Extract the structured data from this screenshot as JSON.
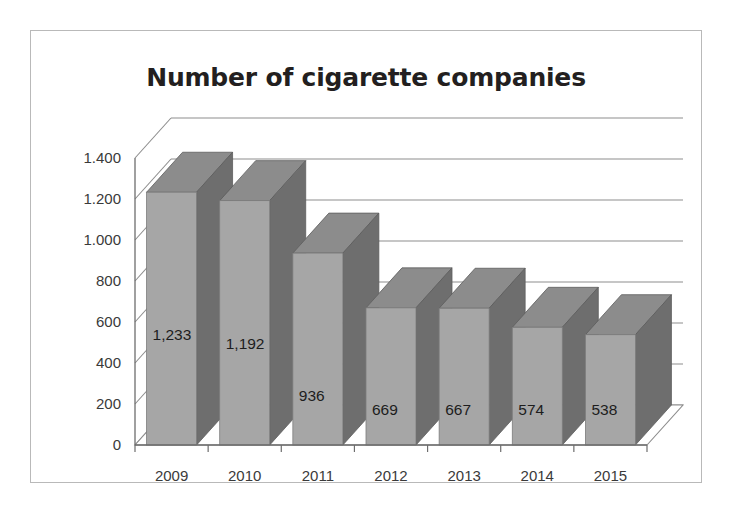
{
  "chart_data": {
    "type": "bar",
    "title": "Number of cigarette companies",
    "xlabel": "",
    "ylabel": "",
    "categories": [
      "2009",
      "2010",
      "2011",
      "2012",
      "2013",
      "2014",
      "2015"
    ],
    "values": [
      1233,
      1192,
      936,
      669,
      667,
      574,
      538
    ],
    "data_labels": [
      "1,233",
      "1,192",
      "936",
      "669",
      "667",
      "574",
      "538"
    ],
    "ytick_labels": [
      "1.400",
      "1.200",
      "1.000",
      "800",
      "600",
      "400",
      "200",
      "0"
    ],
    "ytick_values": [
      1400,
      1200,
      1000,
      800,
      600,
      400,
      200,
      0
    ],
    "ylim": [
      0,
      1400
    ],
    "grid": true,
    "legend": false,
    "style": "3d-column",
    "colors": {
      "bar_front": "#a6a6a6",
      "bar_side": "#6e6e6e",
      "bar_top": "#8c8c8c",
      "gridline": "#8d8d8d",
      "axis": "#6d6d6d",
      "title_text": "#231f20",
      "label_text": "#3a3a3a",
      "border": "#b9b9b9",
      "background": "#ffffff"
    }
  }
}
